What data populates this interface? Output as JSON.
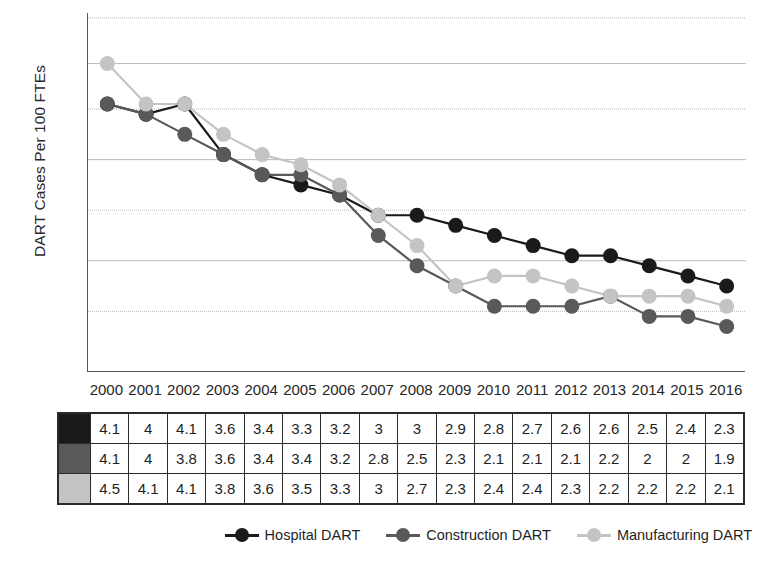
{
  "chart_data": {
    "type": "line",
    "title": "",
    "xlabel": "",
    "ylabel": "DART Cases Per 100 FTEs",
    "categories": [
      "2000",
      "2001",
      "2002",
      "2003",
      "2004",
      "2005",
      "2006",
      "2007",
      "2008",
      "2009",
      "2010",
      "2011",
      "2012",
      "2013",
      "2014",
      "2015",
      "2016"
    ],
    "series": [
      {
        "name": "Hospital DART",
        "color": "#1a1a1a",
        "values": [
          4.1,
          4,
          4.1,
          3.6,
          3.4,
          3.3,
          3.2,
          3,
          3,
          2.9,
          2.8,
          2.7,
          2.6,
          2.6,
          2.5,
          2.4,
          2.3
        ],
        "labels": [
          "4.1",
          "4",
          "4.1",
          "3.6",
          "3.4",
          "3.3",
          "3.2",
          "3",
          "3",
          "2.9",
          "2.8",
          "2.7",
          "2.6",
          "2.6",
          "2.5",
          "2.4",
          "2.3"
        ]
      },
      {
        "name": "Construction DART",
        "color": "#595959",
        "values": [
          4.1,
          4,
          3.8,
          3.6,
          3.4,
          3.4,
          3.2,
          2.8,
          2.5,
          2.3,
          2.1,
          2.1,
          2.1,
          2.2,
          2,
          2,
          1.9
        ],
        "labels": [
          "4.1",
          "4",
          "3.8",
          "3.6",
          "3.4",
          "3.4",
          "3.2",
          "2.8",
          "2.5",
          "2.3",
          "2.1",
          "2.1",
          "2.1",
          "2.2",
          "2",
          "2",
          "1.9"
        ]
      },
      {
        "name": "Manufacturing DART",
        "color": "#c4c4c4",
        "values": [
          4.5,
          4.1,
          4.1,
          3.8,
          3.6,
          3.5,
          3.3,
          3,
          2.7,
          2.3,
          2.4,
          2.4,
          2.3,
          2.2,
          2.2,
          2.2,
          2.1
        ],
        "labels": [
          "4.5",
          "4.1",
          "4.1",
          "3.8",
          "3.6",
          "3.5",
          "3.3",
          "3",
          "2.7",
          "2.3",
          "2.4",
          "2.4",
          "2.3",
          "2.2",
          "2.2",
          "2.2",
          "2.1"
        ]
      }
    ],
    "ylim": [
      1.45,
      5.0
    ],
    "gridlines": [
      4.95,
      4.5,
      4.05,
      3.55,
      3.05,
      2.55,
      2.05
    ],
    "grid": true,
    "y_tick_labels": [],
    "legend_position": "bottom-right",
    "grid_color": "#b8b8b8",
    "axis_color": "#55585c"
  },
  "table": {
    "row_swatches": [
      "#1a1a1a",
      "#595959",
      "#c4c4c4"
    ]
  },
  "legend": {
    "items": [
      {
        "label": "Hospital DART",
        "color": "#1a1a1a"
      },
      {
        "label": "Construction DART",
        "color": "#595959"
      },
      {
        "label": "Manufacturing DART",
        "color": "#c4c4c4"
      }
    ]
  }
}
